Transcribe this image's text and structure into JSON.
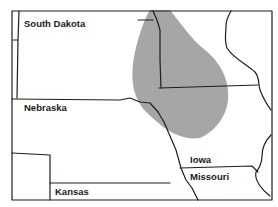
{
  "map": {
    "type": "regional-state-map",
    "colors": {
      "background": "#ffffff",
      "border": "#1e1e1e",
      "shaded_region": "#a6a6a6"
    },
    "states": [
      {
        "id": "south-dakota",
        "label": "South Dakota"
      },
      {
        "id": "nebraska",
        "label": "Nebraska"
      },
      {
        "id": "kansas",
        "label": "Kansas"
      },
      {
        "id": "iowa",
        "label": "Iowa"
      },
      {
        "id": "missouri",
        "label": "Missouri"
      }
    ],
    "shaded_region": {
      "description": "gray shaded area spanning eastern South Dakota, northeastern Nebraska, and western Iowa"
    }
  }
}
